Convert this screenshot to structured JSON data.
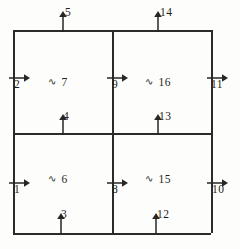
{
  "figure": {
    "stroke_color": "#262626",
    "background_color": "#fdfdfb",
    "grid": {
      "left": 13,
      "top": 30,
      "right": 211,
      "bottom": 233,
      "mid_x": 112,
      "mid_y": 133,
      "rows": 2,
      "columns": 2
    }
  },
  "cells": [
    {
      "id": "top-left",
      "tilde": "∿",
      "label": "7",
      "x": 48,
      "y": 76
    },
    {
      "id": "top-right",
      "tilde": "∿",
      "label": "16",
      "x": 145,
      "y": 76
    },
    {
      "id": "bottom-left",
      "tilde": "∿",
      "label": "6",
      "x": 48,
      "y": 173
    },
    {
      "id": "bottom-right",
      "tilde": "∿",
      "label": "15",
      "x": 145,
      "y": 173
    }
  ],
  "arrows": [
    {
      "id": "arrow-1",
      "label": "1",
      "direction": "right",
      "edge": "outer-left",
      "cell": "bottom-left",
      "ax": 8,
      "ay": 177,
      "lx": 14,
      "ly": 183
    },
    {
      "id": "arrow-2",
      "label": "2",
      "direction": "right",
      "edge": "outer-left",
      "cell": "top-left",
      "ax": 8,
      "ay": 72,
      "lx": 14,
      "ly": 78
    },
    {
      "id": "arrow-3",
      "label": "3",
      "direction": "up",
      "edge": "outer-bottom",
      "cell": "bottom-left",
      "ax": 55,
      "ay": 213,
      "lx": 61,
      "ly": 208
    },
    {
      "id": "arrow-4",
      "label": "4",
      "direction": "up",
      "edge": "inner-horiz",
      "cell": "bottom-left",
      "ax": 57,
      "ay": 114,
      "lx": 63,
      "ly": 110
    },
    {
      "id": "arrow-5",
      "label": "5",
      "direction": "up",
      "edge": "outer-top",
      "cell": "top-left",
      "ax": 57,
      "ay": 11,
      "lx": 65,
      "ly": 6
    },
    {
      "id": "arrow-8",
      "label": "8",
      "direction": "right",
      "edge": "inner-vert",
      "cell": "bottom-right",
      "ax": 106,
      "ay": 177,
      "lx": 112,
      "ly": 183
    },
    {
      "id": "arrow-9",
      "label": "9",
      "direction": "right",
      "edge": "inner-vert",
      "cell": "top-right",
      "ax": 106,
      "ay": 72,
      "lx": 112,
      "ly": 78
    },
    {
      "id": "arrow-10",
      "label": "10",
      "direction": "right",
      "edge": "outer-right",
      "cell": "bottom-right",
      "ax": 206,
      "ay": 177,
      "lx": 212,
      "ly": 183
    },
    {
      "id": "arrow-11",
      "label": "11",
      "direction": "right",
      "edge": "outer-right",
      "cell": "top-right",
      "ax": 206,
      "ay": 72,
      "lx": 211,
      "ly": 78
    },
    {
      "id": "arrow-12",
      "label": "12",
      "direction": "up",
      "edge": "outer-bottom",
      "cell": "bottom-right",
      "ax": 150,
      "ay": 213,
      "lx": 157,
      "ly": 208
    },
    {
      "id": "arrow-13",
      "label": "13",
      "direction": "up",
      "edge": "inner-horiz",
      "cell": "bottom-right",
      "ax": 152,
      "ay": 114,
      "lx": 159,
      "ly": 110
    },
    {
      "id": "arrow-14",
      "label": "14",
      "direction": "up",
      "edge": "outer-top",
      "cell": "top-right",
      "ax": 152,
      "ay": 11,
      "lx": 160,
      "ly": 6
    }
  ]
}
